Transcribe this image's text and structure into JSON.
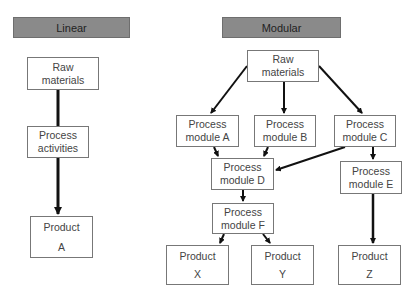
{
  "linear": {
    "header": "Linear",
    "nodes": {
      "raw": [
        "Raw",
        "materials"
      ],
      "process": [
        "Process",
        "activities"
      ],
      "product": [
        "Product",
        "A"
      ]
    }
  },
  "modular": {
    "header": "Modular",
    "nodes": {
      "raw": [
        "Raw",
        "materials"
      ],
      "a": [
        "Process",
        "module A"
      ],
      "b": [
        "Process",
        "module B"
      ],
      "c": [
        "Process",
        "module C"
      ],
      "d": [
        "Process",
        "module D"
      ],
      "e": [
        "Process",
        "module E"
      ],
      "f": [
        "Process",
        "module F"
      ],
      "x": [
        "Product",
        "X"
      ],
      "y": [
        "Product",
        "Y"
      ],
      "z": [
        "Product",
        "Z"
      ]
    }
  },
  "colors": {
    "header_bg": "#8a8a8a",
    "box_border": "#777777",
    "arrow": "#111111"
  }
}
